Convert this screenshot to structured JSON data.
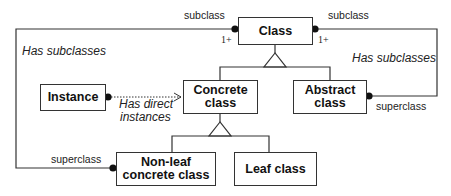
{
  "diagram": {
    "type": "class-hierarchy",
    "nodes": {
      "class": {
        "label": "Class"
      },
      "concrete_class": {
        "label_line1": "Concrete",
        "label_line2": "class"
      },
      "abstract_class": {
        "label_line1": "Abstract",
        "label_line2": "class"
      },
      "instance": {
        "label": "Instance"
      },
      "nonleaf_concrete_class": {
        "label_line1": "Non-leaf",
        "label_line2": "concrete class"
      },
      "leaf_class": {
        "label": "Leaf class"
      }
    },
    "edges": {
      "left_loop": {
        "role_top": "subclass",
        "multiplicity_top": "1+",
        "name": "Has subclasses",
        "role_bottom": "superclass"
      },
      "right_loop": {
        "role_top": "subclass",
        "multiplicity_top": "1+",
        "name": "Has subclasses",
        "role_bottom": "superclass"
      },
      "instance_link": {
        "name_line1": "Has direct",
        "name_line2": "instances"
      }
    },
    "colors": {
      "line": "#333333",
      "text": "#111111",
      "background": "#ffffff"
    }
  }
}
